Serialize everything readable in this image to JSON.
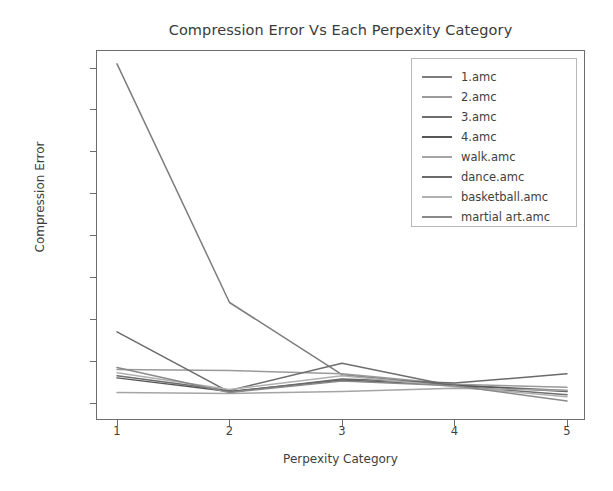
{
  "chart_data": {
    "type": "line",
    "title": "Compression Error Vs Each Perpexity Category",
    "xlabel": "Perpexity Category",
    "ylabel": "Compression Error",
    "x": [
      1,
      2,
      3,
      4,
      5
    ],
    "xticklabels": [
      "1",
      "2",
      "3",
      "4",
      "5"
    ],
    "yticklabels": [
      "0.000",
      "0.002",
      "0.004",
      "0.006",
      "0.008",
      "0.010",
      "0.012",
      "0.014",
      "0.016"
    ],
    "ytickvalues": [
      0.0,
      0.002,
      0.004,
      0.006,
      0.008,
      0.01,
      0.012,
      0.014,
      0.016
    ],
    "xlim": [
      0.8,
      5.2
    ],
    "ylim": [
      -0.0008,
      0.0172
    ],
    "grid": false,
    "legend_position": "upper right",
    "series": [
      {
        "name": "1.amc",
        "color": "#7d7d7d",
        "values": [
          0.0162,
          0.0048,
          0.00135,
          0.00085,
          0.0006
        ]
      },
      {
        "name": "2.amc",
        "color": "#9a9a9a",
        "values": [
          0.0016,
          0.00155,
          0.0014,
          0.0009,
          0.00075
        ]
      },
      {
        "name": "3.amc",
        "color": "#6e6e6e",
        "values": [
          0.0013,
          0.0006,
          0.0019,
          0.0008,
          0.0004
        ]
      },
      {
        "name": "4.amc",
        "color": "#575757",
        "values": [
          0.0012,
          0.00055,
          0.0011,
          0.00085,
          0.00055
        ]
      },
      {
        "name": "walk.amc",
        "color": "#a5a5a5",
        "values": [
          0.0005,
          0.00045,
          0.00055,
          0.0007,
          0.0006
        ]
      },
      {
        "name": "dance.amc",
        "color": "#6a6a6a",
        "values": [
          0.0034,
          0.00052,
          0.00115,
          0.00095,
          0.0014
        ]
      },
      {
        "name": "basketball.amc",
        "color": "#b0b0b0",
        "values": [
          0.00145,
          0.00065,
          0.0013,
          0.00078,
          0.0003
        ]
      },
      {
        "name": "martial art.amc",
        "color": "#8a8a8a",
        "values": [
          0.0017,
          0.0005,
          0.00105,
          0.00082,
          0.0001
        ]
      }
    ]
  }
}
